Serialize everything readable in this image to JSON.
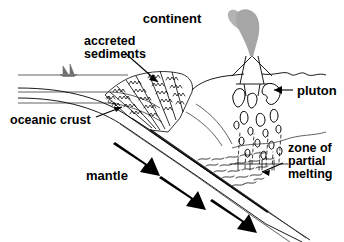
{
  "figure": {
    "width": 344,
    "height": 242,
    "background_color": "#ffffff",
    "line_color": "#000000",
    "plume_color": "#a6a6a6",
    "arrow_color": "#000000"
  },
  "labels": {
    "continent": "continent",
    "accreted_sediments_line1": "accreted",
    "accreted_sediments_line2": "sediments",
    "pluton": "pluton",
    "oceanic_crust": "oceanic crust",
    "mantle": "mantle",
    "zone_line1": "zone of",
    "zone_line2": "partial",
    "zone_line3": "melting"
  },
  "features": {
    "volcano": "volcano-with-ash-plume",
    "ash_plume": "gray-ash-plume",
    "sailboat": "sailboat-on-sea-surface",
    "sea_surface": "sea-surface-line",
    "subducting_slab": "oceanic-plate-descending",
    "accretionary_wedge": "accreted-sediment-wedge",
    "magma_blobs": "rising-magma-teardrops",
    "melt_zone": "partial-melting-squiggles",
    "motion_arrows": "three-subduction-direction-arrows"
  }
}
